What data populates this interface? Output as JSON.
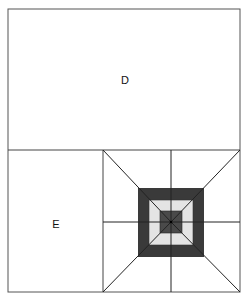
{
  "diagram": {
    "regions": [
      {
        "id": "D",
        "label": "D"
      },
      {
        "id": "E",
        "label": "E"
      }
    ],
    "pattern": {
      "description": "concentric squares with radial lines",
      "colors": {
        "outer_ring": "#3a3a3a",
        "middle_ring": "#e4e4e4",
        "inner_square": "#4a4a4a",
        "lines": "#222222",
        "border": "#555555"
      }
    }
  }
}
